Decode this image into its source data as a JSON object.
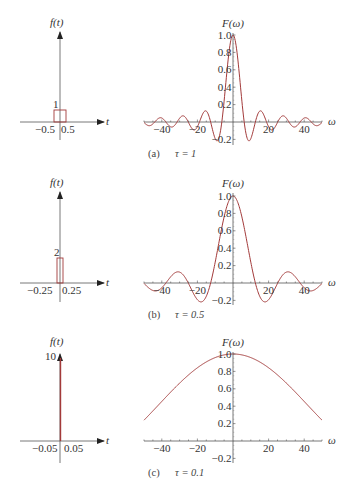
{
  "figure": {
    "header_fragment": "",
    "panels": [
      {
        "id": "a",
        "caption_letter": "(a)",
        "caption_tau": "τ = 1",
        "ft": {
          "ylabel": "f(t)",
          "xlabel": "t",
          "height_label": "1",
          "left_tick": "−0.5",
          "right_tick": "0.5",
          "amplitude": 1,
          "half_width": 0.5
        },
        "Fw": {
          "ylabel": "F(ω)",
          "xlabel": "ω",
          "xticks": [
            "−40",
            "−20",
            "20",
            "40"
          ],
          "yticks": [
            "1.0",
            "0.8",
            "0.6",
            "0.4",
            "0.2",
            "−0.2"
          ]
        }
      },
      {
        "id": "b",
        "caption_letter": "(b)",
        "caption_tau": "τ = 0.5",
        "ft": {
          "ylabel": "f(t)",
          "xlabel": "t",
          "height_label": "2",
          "left_tick": "−0.25",
          "right_tick": "0.25",
          "amplitude": 2,
          "half_width": 0.25
        },
        "Fw": {
          "ylabel": "F(ω)",
          "xlabel": "ω",
          "xticks": [
            "−40",
            "−20",
            "20",
            "40"
          ],
          "yticks": [
            "1.0",
            "0.8",
            "0.6",
            "0.4",
            "0.2",
            "−0.2"
          ]
        }
      },
      {
        "id": "c",
        "caption_letter": "(c)",
        "caption_tau": "τ = 0.1",
        "ft": {
          "ylabel": "f(t)",
          "xlabel": "t",
          "height_label": "10",
          "left_tick": "−0.05",
          "right_tick": "0.05",
          "amplitude": 10,
          "half_width": 0.05
        },
        "Fw": {
          "ylabel": "F(ω)",
          "xlabel": "ω",
          "xticks": [
            "−40",
            "−20",
            "20",
            "40"
          ],
          "yticks": [
            "1.0",
            "0.8",
            "0.6",
            "0.4",
            "0.2",
            "−0.2"
          ]
        }
      }
    ],
    "colors": {
      "curve": "#a33a3a",
      "axis": "#444444",
      "text": "#333333"
    }
  },
  "chart_data": [
    {
      "type": "line",
      "title": "(a) τ = 1 — rectangular pulse f(t)",
      "xlabel": "t",
      "ylabel": "f(t)",
      "x": [
        -0.5,
        -0.5,
        0.5,
        0.5
      ],
      "values": [
        0,
        1,
        1,
        0
      ]
    },
    {
      "type": "line",
      "title": "(a) τ = 1 — spectrum F(ω) = sin(ωτ/2)/(ωτ/2)",
      "xlabel": "ω",
      "ylabel": "F(ω)",
      "tau": 1,
      "xlim": [
        -50,
        50
      ],
      "ylim": [
        -0.2,
        1.0
      ],
      "xticks": [
        -40,
        -20,
        20,
        40
      ],
      "yticks": [
        -0.2,
        0.2,
        0.4,
        0.6,
        0.8,
        1.0
      ],
      "x": [
        -50,
        -40,
        -30,
        -20,
        -10,
        0,
        10,
        20,
        30,
        40,
        50
      ],
      "values": [
        -0.005,
        0.046,
        0.043,
        -0.054,
        -0.192,
        1.0,
        -0.192,
        -0.054,
        0.043,
        0.046,
        -0.005
      ]
    },
    {
      "type": "line",
      "title": "(b) τ = 0.5 — rectangular pulse f(t)",
      "xlabel": "t",
      "ylabel": "f(t)",
      "x": [
        -0.25,
        -0.25,
        0.25,
        0.25
      ],
      "values": [
        0,
        2,
        2,
        0
      ]
    },
    {
      "type": "line",
      "title": "(b) τ = 0.5 — spectrum F(ω)",
      "xlabel": "ω",
      "ylabel": "F(ω)",
      "tau": 0.5,
      "xlim": [
        -50,
        50
      ],
      "ylim": [
        -0.2,
        1.0
      ],
      "xticks": [
        -40,
        -20,
        20,
        40
      ],
      "yticks": [
        -0.2,
        0.2,
        0.4,
        0.6,
        0.8,
        1.0
      ],
      "x": [
        -50,
        -40,
        -30,
        -20,
        -10,
        0,
        10,
        20,
        30,
        40,
        50
      ],
      "values": [
        -0.053,
        0.046,
        0.043,
        -0.054,
        0.383,
        1.0,
        0.383,
        -0.054,
        0.043,
        0.046,
        -0.053
      ]
    },
    {
      "type": "line",
      "title": "(c) τ = 0.1 — rectangular pulse f(t)",
      "xlabel": "t",
      "ylabel": "f(t)",
      "x": [
        -0.05,
        -0.05,
        0.05,
        0.05
      ],
      "values": [
        0,
        10,
        10,
        0
      ]
    },
    {
      "type": "line",
      "title": "(c) τ = 0.1 — spectrum F(ω)",
      "xlabel": "ω",
      "ylabel": "F(ω)",
      "tau": 0.1,
      "xlim": [
        -50,
        50
      ],
      "ylim": [
        -0.2,
        1.0
      ],
      "xticks": [
        -40,
        -20,
        20,
        40
      ],
      "yticks": [
        -0.2,
        0.2,
        0.4,
        0.6,
        0.8,
        1.0
      ],
      "x": [
        -50,
        -40,
        -30,
        -20,
        -10,
        0,
        10,
        20,
        30,
        40,
        50
      ],
      "values": [
        0.239,
        0.455,
        0.665,
        0.841,
        0.959,
        1.0,
        0.959,
        0.841,
        0.665,
        0.455,
        0.239
      ]
    }
  ]
}
